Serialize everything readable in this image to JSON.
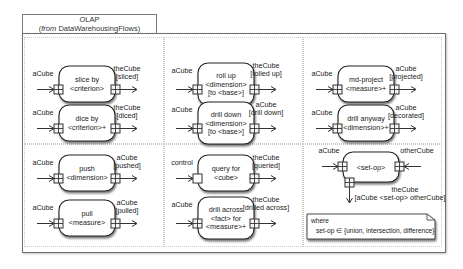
{
  "package": {
    "name": "OLAP",
    "from_prefix": "from",
    "from_name": "DataWarehousingFlows"
  },
  "operations": [
    {
      "id": "slice",
      "label": [
        "slice by",
        "<criterion>"
      ],
      "in_label": "aCube",
      "out_label": [
        "theCube",
        "[sliced]"
      ],
      "in_pin": "cube",
      "out_pin": "cube"
    },
    {
      "id": "dice",
      "label": [
        "dice by",
        "<criterion>+"
      ],
      "in_label": "aCube",
      "out_label": [
        "theCube",
        "[diced]"
      ],
      "in_pin": "cube",
      "out_pin": "cube"
    },
    {
      "id": "rollup",
      "label": [
        "roll up",
        "<dimension>",
        "[to <base>]"
      ],
      "in_label": "aCube",
      "out_label": [
        "theCube",
        "[rolled up]"
      ],
      "in_pin": "cube",
      "out_pin": "cube"
    },
    {
      "id": "drilldown",
      "label": [
        "drill down",
        "<dimension>",
        "[to <base>]"
      ],
      "in_label": "aCube",
      "out_label": [
        "aCube",
        "[drill down]"
      ],
      "in_pin": "cube",
      "out_pin": "cube"
    },
    {
      "id": "mdproject",
      "label": [
        "md-project",
        "<measure>+"
      ],
      "in_label": "aCube",
      "out_label": [
        "aCube",
        "[projected]"
      ],
      "in_pin": "cube",
      "out_pin": "cube"
    },
    {
      "id": "drillanyway",
      "label": [
        "drill anyway",
        "<dimension>+"
      ],
      "in_label": "aCube",
      "out_label": [
        "aCube",
        "[decorated]"
      ],
      "in_pin": "cube",
      "out_pin": "cube"
    },
    {
      "id": "push",
      "label": [
        "push",
        "<dimension>"
      ],
      "in_label": "aCube",
      "out_label": [
        "aCube",
        "[pushed]"
      ],
      "in_pin": "cube",
      "out_pin": "cube"
    },
    {
      "id": "pull",
      "label": [
        "pull",
        "<measure>"
      ],
      "in_label": "aCube",
      "out_label": [
        "aCube",
        "[pulled]"
      ],
      "in_pin": "cube",
      "out_pin": "cube"
    },
    {
      "id": "query",
      "label": [
        "query for",
        "<cube>"
      ],
      "in_label": "control",
      "out_label": [
        "theCube",
        "[queried]"
      ],
      "in_pin": "control",
      "out_pin": "cube"
    },
    {
      "id": "drillacross",
      "label": [
        "drill across",
        "<fact> for",
        "<measure>+"
      ],
      "in_label": "aCube",
      "out_label": [
        "theCube",
        "[drilled across]"
      ],
      "in_pin": "cube",
      "out_pin": "cube"
    }
  ],
  "setop": {
    "label": "<set-op>",
    "in_left_label": "aCube",
    "in_right_label": "otherCube",
    "out_label": [
      "theCube",
      "[aCube <set-op> otherCube]"
    ]
  },
  "note": {
    "line1": "where",
    "line2": "set-op ∈ {union, intersection, difference}"
  }
}
